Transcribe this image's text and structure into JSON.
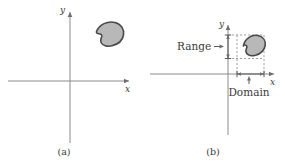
{
  "figure": {
    "name": "domain-and-range-of-a-two-variable-function",
    "panels": [
      {
        "id": "a",
        "caption": "(a)",
        "x_axis_label": "x",
        "y_axis_label": "y",
        "region_name": "shaded-blob-region",
        "annotations": []
      },
      {
        "id": "b",
        "caption": "(b)",
        "x_axis_label": "x",
        "y_axis_label": "y",
        "region_name": "shaded-blob-region",
        "annotations": [
          {
            "id": "range",
            "label": "Range",
            "orientation": "vertical",
            "axis": "y"
          },
          {
            "id": "domain",
            "label": "Domain",
            "orientation": "horizontal",
            "axis": "x"
          }
        ]
      }
    ],
    "colors": {
      "background": "#ffffff",
      "axis": "#8a8a8a",
      "blob_fill": "#b8b8b8",
      "blob_outline": "#4a4a4a",
      "dashed_guide": "#8a8a8a",
      "text": "#3a3a3a"
    }
  }
}
